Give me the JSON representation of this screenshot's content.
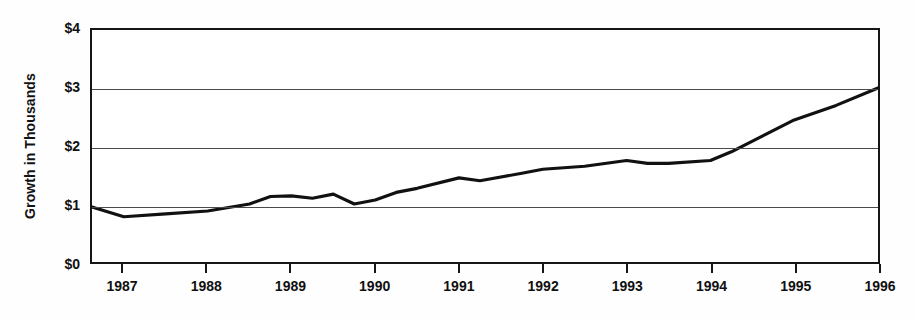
{
  "chart_data": {
    "type": "line",
    "title": "",
    "subtitle": "",
    "xlabel": "",
    "ylabel": "Growth in Thousands",
    "ylim": [
      0,
      4
    ],
    "xlim": [
      1986.62,
      1996.0
    ],
    "grid": true,
    "legend": null,
    "y_tick_labels": [
      "$0",
      "$1",
      "$2",
      "$3",
      "$4"
    ],
    "y_tick_values": [
      0,
      1,
      2,
      3,
      4
    ],
    "x_tick_labels": [
      "1987",
      "1988",
      "1989",
      "1990",
      "1991",
      "1992",
      "1993",
      "1994",
      "1995",
      "1996"
    ],
    "x_tick_values": [
      1987,
      1988,
      1989,
      1990,
      1991,
      1992,
      1993,
      1994,
      1995,
      1996
    ],
    "series": [
      {
        "name": "Growth",
        "color": "#111111",
        "x": [
          1986.62,
          1987.0,
          1987.5,
          1988.0,
          1988.5,
          1988.75,
          1989.0,
          1989.25,
          1989.5,
          1989.75,
          1990.0,
          1990.25,
          1990.5,
          1991.0,
          1991.25,
          1991.75,
          1992.0,
          1992.5,
          1993.0,
          1993.25,
          1993.5,
          1994.0,
          1994.25,
          1995.0,
          1995.5,
          1996.0
        ],
        "y": [
          0.95,
          0.78,
          0.83,
          0.88,
          1.0,
          1.13,
          1.14,
          1.1,
          1.17,
          1.0,
          1.07,
          1.2,
          1.27,
          1.45,
          1.4,
          1.53,
          1.6,
          1.65,
          1.75,
          1.7,
          1.7,
          1.75,
          1.9,
          2.45,
          2.7,
          3.0
        ]
      }
    ]
  }
}
